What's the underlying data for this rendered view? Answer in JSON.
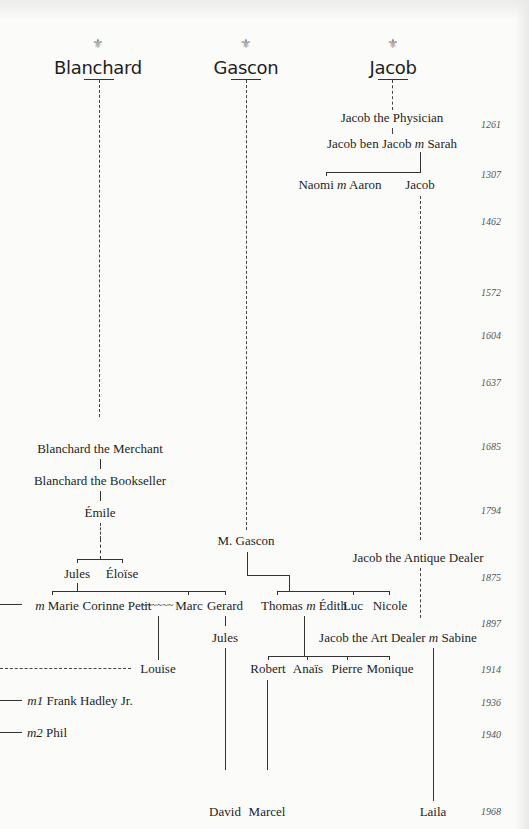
{
  "families": [
    {
      "id": "blanchard",
      "name": "Blanchard",
      "symbol": "⚜"
    },
    {
      "id": "gascon",
      "name": "Gascon",
      "symbol": "⚜"
    },
    {
      "id": "jacob",
      "name": "Jacob",
      "symbol": "⚜"
    }
  ],
  "people": {
    "jacob_physician": "Jacob the Physician",
    "jacob_ben_jacob": "Jacob ben Jacob",
    "sarah": "Sarah",
    "naomi": "Naomi",
    "aaron": "Aaron",
    "jacob": "Jacob",
    "blanchard_merchant": "Blanchard the Merchant",
    "blanchard_bookseller": "Blanchard the Bookseller",
    "emile": "Émile",
    "m_gascon": "M. Gascon",
    "jacob_antique": "Jacob the Antique Dealer",
    "jules": "Jules",
    "eloise": "Éloïse",
    "marie": "Marie",
    "corinne": "Corinne Petit",
    "marc": "Marc",
    "gerard": "Gerard",
    "thomas": "Thomas",
    "edith": "Édith",
    "luc": "Luc",
    "nicole": "Nicole",
    "jules2": "Jules",
    "jacob_art": "Jacob the Art Dealer",
    "sabine": "Sabine",
    "louise": "Louise",
    "robert": "Robert",
    "anais": "Anaïs",
    "pierre": "Pierre",
    "monique": "Monique",
    "frank": "Frank Hadley Jr.",
    "phil": "Phil",
    "david": "David",
    "marcel": "Marcel",
    "laila": "Laila"
  },
  "markers": {
    "married": "m",
    "married1": "m1",
    "married2": "m2",
    "affair": "~~~~~~"
  },
  "years": [
    "1261",
    "1307",
    "1462",
    "1572",
    "1604",
    "1637",
    "1685",
    "1794",
    "1875",
    "1897",
    "1914",
    "1936",
    "1940",
    "1968"
  ]
}
